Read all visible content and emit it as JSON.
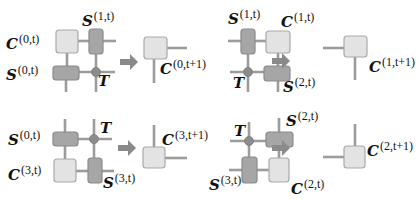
{
  "colors": {
    "core_fill": "#e3e3e3",
    "core_stroke": "#a9a9a9",
    "edge_fill": "#a6a6a6",
    "edge_stroke": "#8a8a8a",
    "bond": "#9c9c9c",
    "site": "#8c8c8c",
    "arrow": "#8a8a8a",
    "text": "#111111"
  },
  "panels": [
    {
      "id": "top-left",
      "labels": [
        {
          "base": "C",
          "sup": "(0,t)",
          "x": 6,
          "y": 33
        },
        {
          "base": "S",
          "sup": "(1,t)",
          "x": 82,
          "y": 10
        },
        {
          "base": "S",
          "sup": "(0,t)",
          "x": 6,
          "y": 64
        },
        {
          "base": "T",
          "sup": "",
          "x": 98,
          "y": 74
        },
        {
          "base": "C",
          "sup": "(0,t+1)",
          "x": 160,
          "y": 58
        }
      ]
    },
    {
      "id": "top-right",
      "labels": [
        {
          "base": "S",
          "sup": "(1,t)",
          "x": 228,
          "y": 8
        },
        {
          "base": "C",
          "sup": "(1,t)",
          "x": 281,
          "y": 11
        },
        {
          "base": "T",
          "sup": "",
          "x": 233,
          "y": 76
        },
        {
          "base": "S",
          "sup": "(2,t)",
          "x": 283,
          "y": 76
        },
        {
          "base": "C",
          "sup": "(1,t+1)",
          "x": 369,
          "y": 56
        }
      ]
    },
    {
      "id": "bottom-left",
      "labels": [
        {
          "base": "S",
          "sup": "(0,t)",
          "x": 8,
          "y": 129
        },
        {
          "base": "T",
          "sup": "",
          "x": 100,
          "y": 121
        },
        {
          "base": "C",
          "sup": "(3,t)",
          "x": 8,
          "y": 164
        },
        {
          "base": "S",
          "sup": "(3,t)",
          "x": 103,
          "y": 172
        },
        {
          "base": "C",
          "sup": "(3,t+1)",
          "x": 162,
          "y": 129
        }
      ]
    },
    {
      "id": "bottom-right",
      "labels": [
        {
          "base": "T",
          "sup": "",
          "x": 234,
          "y": 124
        },
        {
          "base": "S",
          "sup": "(2,t)",
          "x": 286,
          "y": 110
        },
        {
          "base": "S",
          "sup": "(3,t)",
          "x": 209,
          "y": 174
        },
        {
          "base": "C",
          "sup": "(2,t)",
          "x": 291,
          "y": 178
        },
        {
          "base": "C",
          "sup": "(2,t+1)",
          "x": 367,
          "y": 140
        }
      ]
    }
  ]
}
